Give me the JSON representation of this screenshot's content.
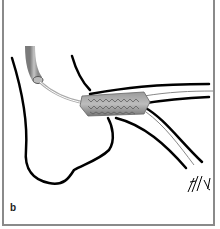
{
  "figure": {
    "panel_label": "b",
    "signature": "hm",
    "colors": {
      "frame": "#8a8a8a",
      "outline": "#000000",
      "stent": "#8c8c8c",
      "catheter": "#a0a0a0"
    }
  }
}
